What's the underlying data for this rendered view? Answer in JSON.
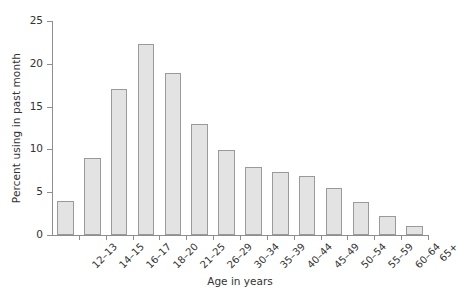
{
  "chart_data": {
    "type": "bar",
    "title": "",
    "subtitle": "",
    "xlabel": "Age in years",
    "ylabel": "Percent using in past month",
    "categories": [
      "12–13",
      "14–15",
      "16–17",
      "18–20",
      "21–25",
      "26–29",
      "30–34",
      "35–39",
      "40–44",
      "45–49",
      "50–54",
      "55–59",
      "60–64",
      "65+"
    ],
    "values": [
      4.0,
      9.0,
      17.0,
      22.3,
      18.9,
      13.0,
      9.9,
      8.0,
      7.4,
      6.9,
      5.5,
      3.8,
      2.2,
      1.1
    ],
    "ylim": [
      0,
      25
    ],
    "yticks": [
      0,
      5,
      10,
      15,
      20,
      25
    ],
    "ytick_labels": [
      "0",
      "5",
      "10",
      "15",
      "20",
      "25"
    ],
    "grid": false,
    "legend": null,
    "bar_fill_color": "#e3e3e3",
    "bar_edge_color": "#9a9a9a",
    "axis_color": "#8e8e8e",
    "text_color": "#333333",
    "background_color": "#ffffff"
  }
}
